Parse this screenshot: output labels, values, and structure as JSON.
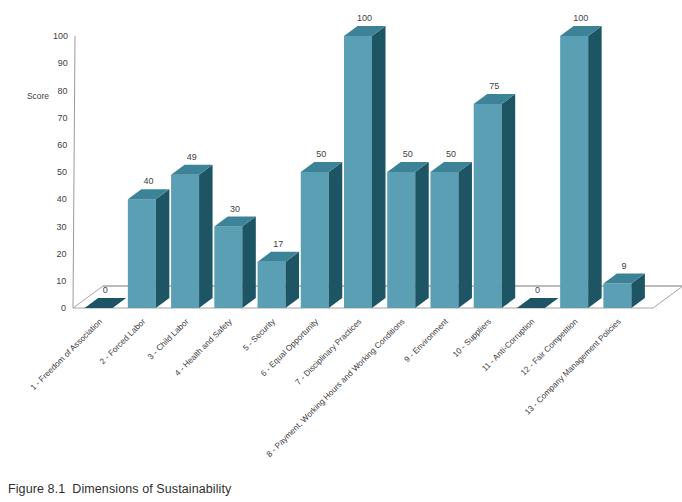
{
  "caption": {
    "number": "Figure 8.1",
    "text": "Dimensions of Sustainability"
  },
  "chart_data": {
    "type": "bar",
    "title": "",
    "subtitle": "",
    "xlabel": "",
    "ylabel": "Score",
    "ylim": [
      0,
      100
    ],
    "yticks": [
      0,
      10,
      20,
      30,
      40,
      50,
      60,
      70,
      80,
      90,
      100
    ],
    "ytick_labels": [
      "0",
      "10",
      "20",
      "30",
      "40",
      "50",
      "60",
      "70",
      "80",
      "90",
      "100"
    ],
    "grid": false,
    "legend": "none",
    "three_d": true,
    "categories": [
      "1 - Freedom of Association",
      "2 - Forced Labor",
      "3 - Child Labor",
      "4 - Health and Safety",
      "5 - Security",
      "6 - Equal Opportunity",
      "7 - Disciplinary Practices",
      "8 - Payment, Working Hours and Working Conditions",
      "9 - Environment",
      "10 - Suppliers",
      "11 - Anti-Corruption",
      "12 - Fair Competition",
      "13 - Company Management Policies"
    ],
    "values": [
      0,
      40,
      49,
      30,
      17,
      50,
      100,
      50,
      50,
      75,
      0,
      100,
      9
    ],
    "data_labels": [
      "0",
      "40",
      "49",
      "30",
      "17",
      "50",
      "100",
      "50",
      "50",
      "75",
      "0",
      "100",
      "9"
    ],
    "colors": {
      "bar_front": "#5b9fb5",
      "bar_side": "#1d5564",
      "bar_top": "#3d8398",
      "axis_line": "#9a9a9a",
      "floor": "#ffffff",
      "floor_edge": "#9a9a9a",
      "text": "#3c3c3c",
      "background": "#ffffff"
    }
  }
}
